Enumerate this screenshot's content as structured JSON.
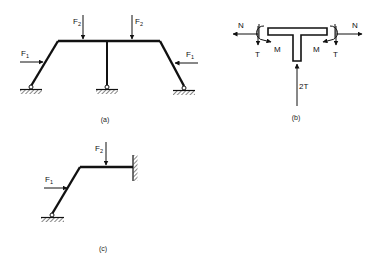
{
  "figures": {
    "a": {
      "caption": "(a)",
      "loads": {
        "F1_left": {
          "base": "F",
          "sub": "1"
        },
        "F1_right": {
          "base": "F",
          "sub": "1"
        },
        "F2_left": {
          "base": "F",
          "sub": "2"
        },
        "F2_right": {
          "base": "F",
          "sub": "2"
        }
      }
    },
    "b": {
      "caption": "(b)",
      "labels": {
        "N_left": "N",
        "N_right": "N",
        "T_left": "T",
        "T_right": "T",
        "M_left": "M",
        "M_right": "M",
        "two_T": "2T"
      }
    },
    "c": {
      "caption": "(c)",
      "loads": {
        "F1": {
          "base": "F",
          "sub": "1"
        },
        "F2": {
          "base": "F",
          "sub": "2"
        }
      }
    }
  },
  "colors": {
    "ink": "#111111",
    "background": "#ffffff"
  }
}
